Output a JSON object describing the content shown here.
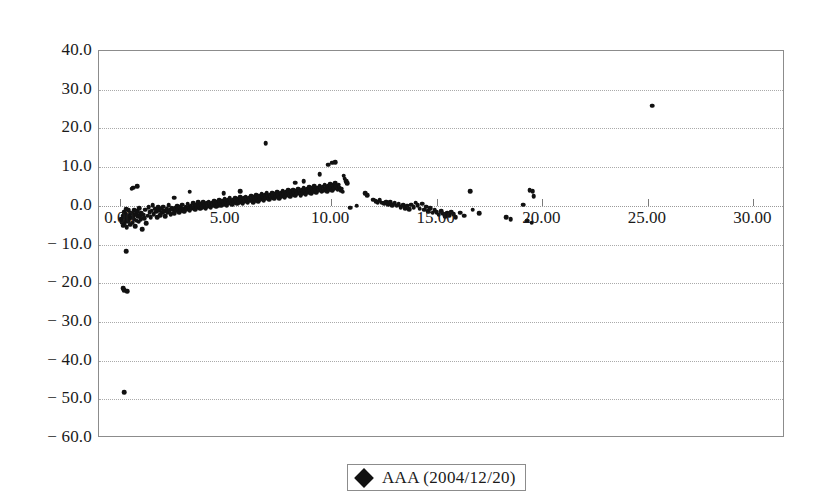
{
  "chart_data": {
    "type": "scatter",
    "title": "",
    "subtitle": "",
    "xlabel": "",
    "ylabel": "",
    "xlim": [
      -1.0,
      31.5
    ],
    "ylim": [
      -60.0,
      40.0
    ],
    "grid": true,
    "grid_axis": "y",
    "legend_position": "bottom-center",
    "x_ticks": [
      0.0,
      5.0,
      10.0,
      15.0,
      20.0,
      25.0,
      30.0
    ],
    "x_tick_labels": [
      "0.00",
      "5.00",
      "10.00",
      "15.00",
      "20.00",
      "25.00",
      "30.00"
    ],
    "y_ticks": [
      40.0,
      30.0,
      20.0,
      10.0,
      0.0,
      -10.0,
      -20.0,
      -30.0,
      -40.0,
      -50.0,
      -60.0
    ],
    "y_tick_labels": [
      "40.0",
      "30.0",
      "20.0",
      "10.0",
      "0.0",
      "− 10.0",
      "− 20.0",
      "− 30.0",
      "− 40.0",
      "− 50.0",
      "− 60.0"
    ],
    "marker": "diamond",
    "marker_color": "#111111",
    "series": [
      {
        "name": "AAA (2004/12/20)",
        "color": "#111111",
        "points": [
          [
            0.05,
            -3.4
          ],
          [
            0.1,
            -4.2
          ],
          [
            0.12,
            -2.6
          ],
          [
            0.15,
            -5.1
          ],
          [
            0.18,
            -3.0
          ],
          [
            0.2,
            -1.6
          ],
          [
            0.22,
            -4.6
          ],
          [
            0.25,
            -2.2
          ],
          [
            0.28,
            -3.8
          ],
          [
            0.3,
            -0.9
          ],
          [
            0.32,
            -5.6
          ],
          [
            0.35,
            -2.9
          ],
          [
            0.38,
            -4.0
          ],
          [
            0.4,
            -1.2
          ],
          [
            0.42,
            -3.3
          ],
          [
            0.45,
            -2.4
          ],
          [
            0.48,
            -4.9
          ],
          [
            0.5,
            -1.8
          ],
          [
            0.55,
            -3.1
          ],
          [
            0.58,
            -2.0
          ],
          [
            0.6,
            -4.4
          ],
          [
            0.65,
            -2.7
          ],
          [
            0.68,
            -1.1
          ],
          [
            0.7,
            -3.6
          ],
          [
            0.72,
            -5.3
          ],
          [
            0.75,
            -2.1
          ],
          [
            0.78,
            -3.9
          ],
          [
            0.82,
            -1.4
          ],
          [
            0.85,
            -2.8
          ],
          [
            0.88,
            -4.1
          ],
          [
            0.9,
            -0.6
          ],
          [
            0.95,
            -2.5
          ],
          [
            0.98,
            -3.5
          ],
          [
            1.0,
            -1.9
          ],
          [
            1.05,
            -6.0
          ],
          [
            1.1,
            -2.3
          ],
          [
            1.15,
            -3.2
          ],
          [
            1.2,
            -1.0
          ],
          [
            1.25,
            -4.5
          ],
          [
            1.3,
            -2.6
          ],
          [
            0.62,
            4.7
          ],
          [
            0.8,
            5.1
          ],
          [
            0.55,
            4.4
          ],
          [
            1.35,
            -0.4
          ],
          [
            1.4,
            -1.7
          ],
          [
            1.45,
            -2.9
          ],
          [
            1.5,
            -1.3
          ],
          [
            1.55,
            0.2
          ],
          [
            1.6,
            -2.2
          ],
          [
            1.65,
            -0.8
          ],
          [
            1.7,
            -1.5
          ],
          [
            1.75,
            -3.0
          ],
          [
            1.8,
            -0.3
          ],
          [
            1.85,
            -1.1
          ],
          [
            1.9,
            -2.4
          ],
          [
            1.95,
            -0.7
          ],
          [
            2.0,
            -1.8
          ],
          [
            2.05,
            -0.2
          ],
          [
            2.1,
            -1.4
          ],
          [
            2.15,
            -2.7
          ],
          [
            2.2,
            -0.9
          ],
          [
            2.25,
            -1.6
          ],
          [
            2.3,
            0.1
          ],
          [
            2.35,
            -1.2
          ],
          [
            2.4,
            -2.1
          ],
          [
            2.45,
            -0.5
          ],
          [
            2.5,
            -1.0
          ],
          [
            2.55,
            -1.9
          ],
          [
            2.6,
            -0.6
          ],
          [
            2.65,
            -1.3
          ],
          [
            2.7,
            -0.1
          ],
          [
            2.75,
            -0.8
          ],
          [
            2.8,
            -1.7
          ],
          [
            2.85,
            -0.4
          ],
          [
            2.9,
            -1.1
          ],
          [
            2.95,
            0.3
          ],
          [
            3.0,
            -0.7
          ],
          [
            3.05,
            -1.5
          ],
          [
            3.1,
            -0.2
          ],
          [
            3.15,
            -0.9
          ],
          [
            3.2,
            0.5
          ],
          [
            3.25,
            -0.4
          ],
          [
            3.3,
            -1.2
          ],
          [
            3.35,
            0.0
          ],
          [
            3.4,
            -0.6
          ],
          [
            3.45,
            0.7
          ],
          [
            3.5,
            -0.3
          ],
          [
            3.55,
            -1.0
          ],
          [
            3.6,
            0.2
          ],
          [
            3.65,
            -0.5
          ],
          [
            3.7,
            0.9
          ],
          [
            3.75,
            -0.1
          ],
          [
            3.8,
            -0.8
          ],
          [
            3.85,
            0.4
          ],
          [
            3.9,
            -0.3
          ],
          [
            3.95,
            1.0
          ],
          [
            4.0,
            0.1
          ],
          [
            4.05,
            -0.6
          ],
          [
            3.3,
            3.6
          ],
          [
            2.55,
            2.1
          ],
          [
            4.1,
            0.6
          ],
          [
            4.15,
            -0.2
          ],
          [
            4.2,
            1.1
          ],
          [
            4.25,
            0.3
          ],
          [
            4.3,
            -0.4
          ],
          [
            4.35,
            0.8
          ],
          [
            4.4,
            0.0
          ],
          [
            4.45,
            1.3
          ],
          [
            4.5,
            0.5
          ],
          [
            4.55,
            -0.2
          ],
          [
            4.6,
            1.0
          ],
          [
            4.65,
            0.2
          ],
          [
            4.7,
            1.5
          ],
          [
            4.75,
            0.7
          ],
          [
            4.8,
            0.0
          ],
          [
            4.85,
            1.2
          ],
          [
            4.9,
            0.4
          ],
          [
            4.95,
            1.7
          ],
          [
            5.0,
            0.9
          ],
          [
            5.05,
            0.1
          ],
          [
            5.1,
            1.4
          ],
          [
            5.15,
            0.6
          ],
          [
            5.2,
            1.9
          ],
          [
            5.25,
            1.1
          ],
          [
            5.3,
            0.3
          ],
          [
            5.35,
            1.6
          ],
          [
            5.4,
            0.8
          ],
          [
            5.45,
            2.0
          ],
          [
            5.5,
            1.2
          ],
          [
            5.55,
            0.5
          ],
          [
            5.6,
            1.8
          ],
          [
            5.65,
            1.0
          ],
          [
            5.7,
            2.2
          ],
          [
            5.75,
            1.4
          ],
          [
            5.8,
            0.7
          ],
          [
            5.85,
            1.9
          ],
          [
            5.9,
            1.1
          ],
          [
            5.95,
            2.4
          ],
          [
            6.0,
            1.6
          ],
          [
            6.05,
            0.9
          ],
          [
            4.9,
            3.2
          ],
          [
            5.7,
            3.7
          ],
          [
            6.1,
            2.1
          ],
          [
            6.15,
            1.3
          ],
          [
            6.2,
            2.6
          ],
          [
            6.25,
            1.8
          ],
          [
            6.3,
            1.0
          ],
          [
            6.35,
            2.3
          ],
          [
            6.4,
            1.5
          ],
          [
            6.45,
            2.8
          ],
          [
            6.5,
            2.0
          ],
          [
            6.55,
            1.2
          ],
          [
            6.6,
            2.5
          ],
          [
            6.65,
            1.7
          ],
          [
            6.7,
            3.0
          ],
          [
            6.75,
            2.2
          ],
          [
            6.8,
            1.4
          ],
          [
            6.85,
            2.7
          ],
          [
            6.9,
            1.9
          ],
          [
            6.95,
            3.2
          ],
          [
            7.0,
            2.4
          ],
          [
            7.05,
            1.6
          ],
          [
            6.9,
            16.2
          ],
          [
            7.1,
            2.9
          ],
          [
            7.15,
            2.1
          ],
          [
            7.2,
            3.4
          ],
          [
            7.25,
            2.6
          ],
          [
            7.3,
            1.8
          ],
          [
            7.35,
            3.1
          ],
          [
            7.4,
            2.3
          ],
          [
            7.45,
            3.6
          ],
          [
            7.5,
            2.8
          ],
          [
            7.55,
            2.0
          ],
          [
            7.6,
            3.3
          ],
          [
            7.65,
            2.5
          ],
          [
            7.7,
            3.8
          ],
          [
            7.75,
            3.0
          ],
          [
            7.8,
            2.2
          ],
          [
            7.85,
            3.5
          ],
          [
            7.9,
            2.7
          ],
          [
            7.95,
            4.0
          ],
          [
            8.0,
            3.2
          ],
          [
            8.05,
            2.4
          ],
          [
            8.1,
            3.7
          ],
          [
            8.15,
            2.9
          ],
          [
            8.2,
            4.2
          ],
          [
            8.25,
            3.4
          ],
          [
            8.3,
            2.6
          ],
          [
            8.35,
            3.9
          ],
          [
            8.4,
            3.1
          ],
          [
            8.45,
            4.4
          ],
          [
            8.5,
            3.6
          ],
          [
            8.55,
            2.8
          ],
          [
            8.6,
            4.1
          ],
          [
            8.65,
            3.3
          ],
          [
            8.7,
            4.6
          ],
          [
            8.75,
            3.8
          ],
          [
            8.8,
            3.0
          ],
          [
            8.85,
            4.3
          ],
          [
            8.9,
            3.5
          ],
          [
            8.95,
            4.8
          ],
          [
            9.0,
            4.0
          ],
          [
            9.05,
            3.2
          ],
          [
            8.3,
            6.0
          ],
          [
            8.7,
            6.4
          ],
          [
            9.1,
            4.5
          ],
          [
            9.15,
            3.7
          ],
          [
            9.2,
            5.0
          ],
          [
            9.25,
            4.2
          ],
          [
            9.3,
            3.4
          ],
          [
            9.35,
            4.7
          ],
          [
            9.4,
            3.9
          ],
          [
            9.45,
            5.2
          ],
          [
            9.5,
            4.4
          ],
          [
            9.55,
            3.6
          ],
          [
            9.6,
            4.9
          ],
          [
            9.65,
            4.1
          ],
          [
            9.7,
            5.4
          ],
          [
            9.75,
            4.6
          ],
          [
            9.8,
            3.8
          ],
          [
            9.85,
            5.1
          ],
          [
            9.9,
            4.3
          ],
          [
            9.95,
            5.6
          ],
          [
            10.0,
            4.8
          ],
          [
            10.05,
            4.0
          ],
          [
            9.45,
            8.1
          ],
          [
            9.85,
            10.6
          ],
          [
            10.05,
            11.1
          ],
          [
            10.2,
            11.3
          ],
          [
            10.1,
            5.3
          ],
          [
            10.15,
            4.5
          ],
          [
            10.2,
            5.8
          ],
          [
            10.25,
            5.0
          ],
          [
            10.3,
            4.2
          ],
          [
            10.35,
            5.5
          ],
          [
            10.4,
            4.7
          ],
          [
            10.45,
            3.9
          ],
          [
            10.5,
            4.4
          ],
          [
            10.55,
            3.6
          ],
          [
            10.6,
            7.8
          ],
          [
            10.65,
            7.0
          ],
          [
            10.7,
            6.3
          ],
          [
            10.75,
            5.8
          ],
          [
            10.9,
            -0.5
          ],
          [
            11.2,
            0.0
          ],
          [
            11.6,
            3.2
          ],
          [
            11.7,
            2.8
          ],
          [
            12.0,
            1.6
          ],
          [
            12.1,
            1.2
          ],
          [
            12.2,
            1.0
          ],
          [
            12.3,
            1.4
          ],
          [
            12.4,
            0.8
          ],
          [
            12.5,
            0.6
          ],
          [
            12.6,
            1.1
          ],
          [
            12.7,
            0.4
          ],
          [
            12.8,
            0.9
          ],
          [
            12.9,
            0.2
          ],
          [
            13.0,
            0.6
          ],
          [
            13.1,
            0.0
          ],
          [
            13.2,
            0.4
          ],
          [
            13.3,
            -0.3
          ],
          [
            13.4,
            0.2
          ],
          [
            13.5,
            -0.6
          ],
          [
            13.6,
            0.0
          ],
          [
            13.7,
            -0.9
          ],
          [
            13.8,
            0.3
          ],
          [
            13.9,
            -0.4
          ],
          [
            14.0,
            0.8
          ],
          [
            14.1,
            0.1
          ],
          [
            14.2,
            -0.7
          ],
          [
            14.3,
            0.5
          ],
          [
            14.4,
            -1.0
          ],
          [
            14.5,
            -0.2
          ],
          [
            14.6,
            -1.4
          ],
          [
            14.7,
            -0.6
          ],
          [
            14.8,
            -1.8
          ],
          [
            14.9,
            -1.1
          ],
          [
            15.0,
            -1.6
          ],
          [
            15.1,
            -2.3
          ],
          [
            15.2,
            -1.4
          ],
          [
            15.3,
            -2.0
          ],
          [
            15.4,
            -2.7
          ],
          [
            15.5,
            -1.9
          ],
          [
            15.6,
            -2.5
          ],
          [
            15.7,
            -1.7
          ],
          [
            15.8,
            -2.2
          ],
          [
            15.9,
            -3.0
          ],
          [
            16.1,
            -1.8
          ],
          [
            16.3,
            -2.6
          ],
          [
            16.6,
            3.8
          ],
          [
            16.7,
            -1.0
          ],
          [
            17.0,
            -1.9
          ],
          [
            18.3,
            -2.9
          ],
          [
            18.5,
            -3.4
          ],
          [
            19.1,
            0.3
          ],
          [
            19.4,
            4.1
          ],
          [
            19.55,
            3.7
          ],
          [
            19.6,
            2.5
          ],
          [
            19.3,
            -3.9
          ],
          [
            19.5,
            -4.4
          ],
          [
            25.2,
            25.9
          ],
          [
            0.3,
            -11.8
          ],
          [
            0.15,
            -21.3
          ],
          [
            0.2,
            -21.8
          ],
          [
            0.35,
            -22.0
          ],
          [
            0.18,
            -48.2
          ]
        ]
      }
    ]
  },
  "legend": {
    "label": "AAA (2004/12/20)",
    "marker_name": "diamond-marker"
  }
}
